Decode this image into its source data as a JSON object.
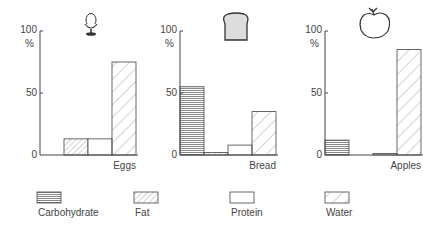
{
  "chart_data": [
    {
      "type": "bar",
      "title": "Eggs",
      "icon": "egg-in-cup-icon",
      "categories": [
        "Carbohydrate",
        "Fat",
        "Protein",
        "Water"
      ],
      "values": [
        0,
        13,
        13,
        75
      ],
      "ylabel": "%",
      "yticks": [
        "0",
        "50",
        "100"
      ],
      "ylim": [
        0,
        100
      ]
    },
    {
      "type": "bar",
      "title": "Bread",
      "icon": "bread-slice-icon",
      "categories": [
        "Carbohydrate",
        "Fat",
        "Protein",
        "Water"
      ],
      "values": [
        55,
        2,
        8,
        35
      ],
      "ylabel": "%",
      "yticks": [
        "0",
        "50",
        "100"
      ],
      "ylim": [
        0,
        100
      ]
    },
    {
      "type": "bar",
      "title": "Apples",
      "icon": "apple-icon",
      "categories": [
        "Carbohydrate",
        "Fat",
        "Protein",
        "Water"
      ],
      "values": [
        12,
        0,
        0.5,
        85
      ],
      "ylabel": "%",
      "yticks": [
        "0",
        "50",
        "100"
      ],
      "ylim": [
        0,
        100
      ]
    }
  ],
  "legend": [
    {
      "label": "Carbohydrate",
      "pattern": "horizontal-lines"
    },
    {
      "label": "Fat",
      "pattern": "dense-diagonal"
    },
    {
      "label": "Protein",
      "pattern": "blank"
    },
    {
      "label": "Water",
      "pattern": "sparse-diagonal"
    }
  ],
  "axis": {
    "unit": "%",
    "tick_0": "0",
    "tick_50": "50",
    "tick_100": "100"
  }
}
